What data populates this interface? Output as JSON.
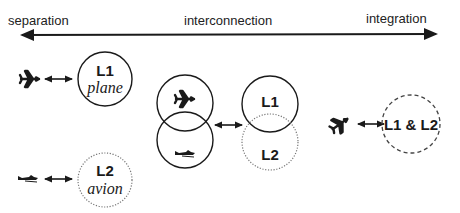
{
  "continuum": {
    "left_label": "separation",
    "middle_label": "interconnection",
    "right_label": "integration"
  },
  "separation": {
    "l1": {
      "label": "L1",
      "word": "plane",
      "border": "solid",
      "icon": "airplane-icon"
    },
    "l2": {
      "label": "L2",
      "word": "avion",
      "border": "dotted",
      "icon": "small-airplane-icon"
    }
  },
  "interconnection": {
    "concept_circles": [
      {
        "icon": "airplane-icon",
        "border": "solid"
      },
      {
        "icon": "small-airplane-icon",
        "border": "solid"
      }
    ],
    "language_circles": [
      {
        "label": "L1",
        "border": "solid"
      },
      {
        "label": "L2",
        "border": "dotted"
      }
    ]
  },
  "integration": {
    "label": "L1 & L2",
    "border": "dashed",
    "icon": "airplane-icon"
  },
  "colors": {
    "ink": "#1a1a1a",
    "dotted": "#777777",
    "background": "#ffffff"
  }
}
